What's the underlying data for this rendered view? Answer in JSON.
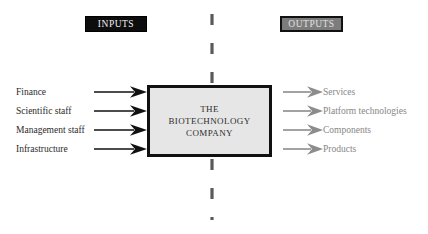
{
  "diagram": {
    "title_inputs": "INPUTS",
    "title_outputs": "OUTPUTS",
    "center_box": {
      "line1": "THE",
      "line2": "BIOTECHNOLOGY",
      "line3": "COMPANY"
    },
    "inputs": [
      {
        "label": "Finance"
      },
      {
        "label": "Scientific staff"
      },
      {
        "label": "Management staff"
      },
      {
        "label": "Infrastructure"
      }
    ],
    "outputs": [
      {
        "label": "Services"
      },
      {
        "label": "Platform technologies"
      },
      {
        "label": "Components"
      },
      {
        "label": "Products"
      }
    ],
    "colors": {
      "background": "#ffffff",
      "inputs_badge_fill": "#0d0d0d",
      "inputs_badge_text": "#f2f2f2",
      "outputs_badge_fill": "#7c7c7c",
      "outputs_badge_text": "#e2e2e2",
      "box_fill": "#e6e6e6",
      "box_border": "#111111",
      "box_text": "#2e2e2e",
      "input_arrow": "#111111",
      "output_arrow": "#8c8c8c",
      "input_text": "#2b2b2b",
      "output_text": "#868686",
      "divider": "#5a5a5a"
    }
  }
}
